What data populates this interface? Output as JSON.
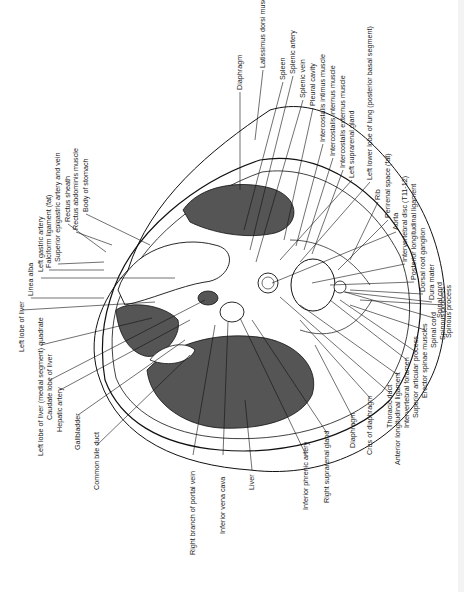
{
  "figure": {
    "type": "anatomical cross-section (axial, T11-T12 level)",
    "colors": {
      "organ_fill": "#555555",
      "line": "#111111",
      "background": "#ffffff"
    }
  },
  "labels_top": [
    {
      "text": "Diaphragm",
      "x": 240,
      "y": 90
    },
    {
      "text": "Latissimus dorsi muscle",
      "x": 263,
      "y": 68
    },
    {
      "text": "Spleen",
      "x": 283,
      "y": 80
    },
    {
      "text": "Splenic artery",
      "x": 293,
      "y": 74
    },
    {
      "text": "Splenic vein",
      "x": 303,
      "y": 98
    },
    {
      "text": "Pleural cavity",
      "x": 313,
      "y": 106
    },
    {
      "text": "Intercostalis intimus muscle",
      "x": 323,
      "y": 142
    },
    {
      "text": "Intercostalis internus muscle",
      "x": 333,
      "y": 156
    },
    {
      "text": "Intercostalis externus muscle",
      "x": 343,
      "y": 168
    },
    {
      "text": "Left suprarenal gland",
      "x": 352,
      "y": 178
    },
    {
      "text": "Left lower lobe of lung (posterior basal segment)",
      "x": 370,
      "y": 180
    },
    {
      "text": "Rib",
      "x": 378,
      "y": 200
    },
    {
      "text": "Perirenal space (fat)",
      "x": 388,
      "y": 218
    },
    {
      "text": "Aorta",
      "x": 396,
      "y": 230
    },
    {
      "text": "Intervertebral disc (T11-12)",
      "x": 405,
      "y": 262
    },
    {
      "text": "Posterior longitudinal ligament",
      "x": 414,
      "y": 280
    },
    {
      "text": "Dorsal root ganglion",
      "x": 423,
      "y": 292
    },
    {
      "text": "Dura mater",
      "x": 432,
      "y": 300
    },
    {
      "text": "Spinal cord",
      "x": 440,
      "y": 318
    },
    {
      "text": "Spinous process",
      "x": 449,
      "y": 338
    }
  ],
  "labels_left_top": [
    {
      "text": "Body of stomach",
      "x": 86,
      "y": 212
    },
    {
      "text": "Rectus abdominis muscle",
      "x": 76,
      "y": 230
    },
    {
      "text": "Rectus sheath",
      "x": 68,
      "y": 222
    },
    {
      "text": "Superior epigastric artery and vein",
      "x": 58,
      "y": 262
    },
    {
      "text": "Falciform ligament (fat)",
      "x": 49,
      "y": 268
    },
    {
      "text": "Left gastric artery",
      "x": 41,
      "y": 272
    },
    {
      "text": "Linea alba",
      "x": 31,
      "y": 296
    },
    {
      "text": "Left lobe of liver",
      "x": 22,
      "y": 352
    }
  ],
  "labels_left_bottom": [
    {
      "text": "Left lobe of liver (medial segment) quadrate",
      "x": 41,
      "y": 456
    },
    {
      "text": "Caudate lobe of liver",
      "x": 50,
      "y": 420
    },
    {
      "text": "Hepatic artery",
      "x": 60,
      "y": 432
    },
    {
      "text": "Gallbladder",
      "x": 78,
      "y": 450
    },
    {
      "text": "Common bile duct",
      "x": 97,
      "y": 490
    },
    {
      "text": "Right branch of portal vein",
      "x": 193,
      "y": 555
    },
    {
      "text": "Inferior vena cava",
      "x": 223,
      "y": 534
    },
    {
      "text": "Liver",
      "x": 252,
      "y": 490
    },
    {
      "text": "Inferior phrenic artery",
      "x": 306,
      "y": 510
    },
    {
      "text": "Right suprarenal gland",
      "x": 327,
      "y": 503
    },
    {
      "text": "Diaphragm",
      "x": 353,
      "y": 448
    },
    {
      "text": "Crus of diaphragm",
      "x": 370,
      "y": 455
    },
    {
      "text": "Thoracic duct",
      "x": 390,
      "y": 428
    },
    {
      "text": "Anterior longitudinal ligament",
      "x": 398,
      "y": 465
    },
    {
      "text": "Intervertebral foramen",
      "x": 407,
      "y": 428
    },
    {
      "text": "Superior articular process",
      "x": 416,
      "y": 418
    },
    {
      "text": "Erector spinae muscles",
      "x": 425,
      "y": 398
    },
    {
      "text": "Spinal cord",
      "x": 434,
      "y": 348
    },
    {
      "text": "Spinous process",
      "x": 443,
      "y": 340
    }
  ]
}
